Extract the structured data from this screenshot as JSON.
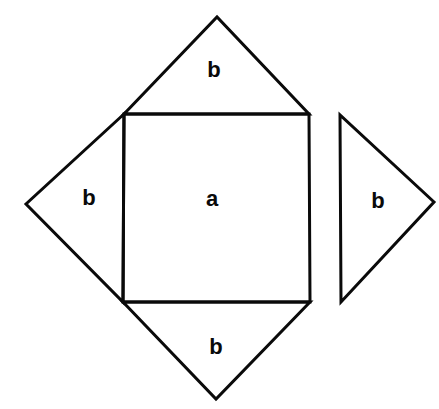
{
  "diagram": {
    "type": "geometric-dissection",
    "colors": {
      "stroke": "#0a0a0a",
      "background": "#ffffff"
    },
    "square": {
      "label": "a",
      "points": [
        [
          124,
          114
        ],
        [
          309,
          114
        ],
        [
          310,
          302
        ],
        [
          123,
          302
        ]
      ],
      "label_pos": [
        212,
        199
      ]
    },
    "triangles": [
      {
        "id": "top",
        "label": "b",
        "points": [
          [
            124,
            114
          ],
          [
            217,
            17
          ],
          [
            309,
            114
          ]
        ],
        "label_pos": [
          214,
          70
        ]
      },
      {
        "id": "left",
        "label": "b",
        "points": [
          [
            124,
            114
          ],
          [
            26,
            204
          ],
          [
            123,
            302
          ]
        ],
        "label_pos": [
          89,
          198
        ]
      },
      {
        "id": "bottom",
        "label": "b",
        "points": [
          [
            123,
            302
          ],
          [
            216,
            399
          ],
          [
            310,
            302
          ]
        ],
        "label_pos": [
          216,
          347
        ]
      },
      {
        "id": "right-detached",
        "label": "b",
        "points": [
          [
            340,
            115
          ],
          [
            341,
            302
          ],
          [
            434,
            202
          ]
        ],
        "label_pos": [
          378,
          201
        ]
      }
    ]
  }
}
